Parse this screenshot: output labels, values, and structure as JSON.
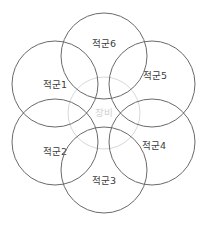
{
  "diagram": {
    "type": "venn-cluster",
    "background_color": "#ffffff",
    "outer_stroke_color": "#6a6a6a",
    "center_stroke_color": "#d8d8d8",
    "outer_label_color": "#3c3c3c",
    "center_label_color": "#cfcfcf",
    "center": {
      "label": "장비",
      "cx": 104,
      "cy": 113,
      "r": 36
    },
    "nodes": [
      {
        "label": "적군1",
        "cx": 55,
        "cy": 84,
        "r": 43,
        "name": "enemy-1"
      },
      {
        "label": "적군2",
        "cx": 55,
        "cy": 142,
        "r": 43,
        "name": "enemy-2"
      },
      {
        "label": "적군3",
        "cx": 104,
        "cy": 170,
        "r": 43,
        "name": "enemy-3"
      },
      {
        "label": "적군4",
        "cx": 152,
        "cy": 142,
        "r": 43,
        "name": "enemy-4"
      },
      {
        "label": "적군5",
        "cx": 152,
        "cy": 84,
        "r": 43,
        "name": "enemy-5"
      },
      {
        "label": "적군6",
        "cx": 104,
        "cy": 56,
        "r": 43,
        "name": "enemy-6"
      }
    ]
  }
}
